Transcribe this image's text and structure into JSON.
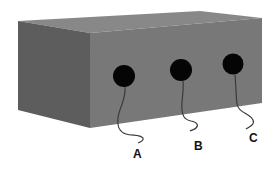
{
  "figure": {
    "colors": {
      "background": "#ffffff",
      "top_face": "#8a8a8a",
      "left_face": "#5e5e5e",
      "front_face": "#7a7a7a",
      "hole": "#050505",
      "wire": "#3a3a3a",
      "label": "#111111"
    },
    "holes": [
      {
        "label": "A",
        "cx": 124,
        "cy": 76,
        "r": 11
      },
      {
        "label": "B",
        "cx": 181,
        "cy": 70,
        "r": 11
      },
      {
        "label": "C",
        "cx": 233,
        "cy": 64,
        "r": 10.5
      }
    ],
    "labels": {
      "a": "A",
      "b": "B",
      "c": "C"
    }
  }
}
